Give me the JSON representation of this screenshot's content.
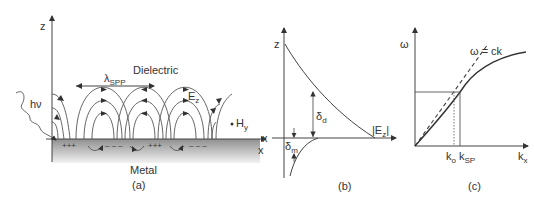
{
  "panel_a": {
    "axis_z": "z",
    "axis_x": "x",
    "dielectric": "Dielectric",
    "metal": "Metal",
    "wavelength_main": "λ",
    "wavelength_sub": "SPP",
    "photon": "hν",
    "field_e_main": "E",
    "field_e_sub": "z",
    "field_h_main": "H",
    "field_h_sub": "y",
    "charges": [
      "+++",
      "– – –",
      "+++",
      "– – –"
    ],
    "caption": "(a)",
    "metal_color": "#9a9a9a"
  },
  "panel_b": {
    "axis_z": "z",
    "axis_x": "x",
    "delta_d_main": "δ",
    "delta_d_sub": "d",
    "delta_m_main": "δ",
    "delta_m_sub": "m",
    "field_label": "|E",
    "field_sub": "z",
    "field_close": "|",
    "caption": "(b)"
  },
  "panel_c": {
    "axis_y": "ω",
    "axis_x_main": "k",
    "axis_x_sub": "x",
    "light_line": "ω = ck",
    "k0_main": "k",
    "k0_sub": "o",
    "ksp_main": "k",
    "ksp_sub": "SP",
    "caption": "(c)"
  }
}
